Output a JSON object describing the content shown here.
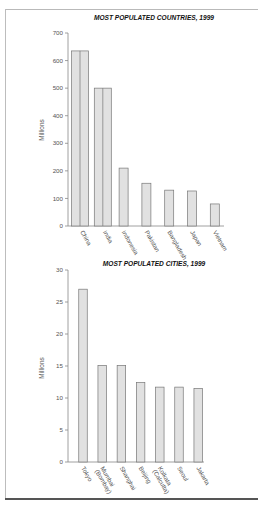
{
  "chart_data": [
    {
      "type": "bar",
      "title": "MOST POPULATED COUNTRIES, 1999",
      "xlabel": "",
      "ylabel": "Millions",
      "ylim": [
        0,
        700
      ],
      "yticks": [
        0,
        100,
        200,
        300,
        400,
        500,
        600,
        700
      ],
      "grid": false,
      "categories": [
        "China",
        "India",
        "Indonesia",
        "Pakistan",
        "Bangladesh",
        "Japan",
        "Vietnam"
      ],
      "values": [
        635,
        500,
        210,
        155,
        130,
        127,
        80
      ],
      "bar_color": "#e1e1e1",
      "note": "China and India bars drawn as double-width bars split by a vertical line"
    },
    {
      "type": "bar",
      "title": "MOST POPULATED CITIES, 1999",
      "xlabel": "",
      "ylabel": "Millions",
      "ylim": [
        0,
        30
      ],
      "yticks": [
        0,
        5,
        10,
        15,
        20,
        25,
        30
      ],
      "grid": false,
      "categories": [
        "Tokyo",
        "Mumbai (Bombay)",
        "Shanghai",
        "Beijing",
        "Kolkata (Calcutta)",
        "Seoul",
        "Jakarta"
      ],
      "values": [
        27,
        15.1,
        15.1,
        12.4,
        11.7,
        11.7,
        11.5
      ],
      "bar_color": "#e1e1e1"
    }
  ]
}
